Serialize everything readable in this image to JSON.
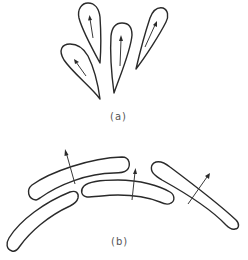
{
  "figure": {
    "panels": [
      {
        "id": "a",
        "label": "(a)",
        "description": "Four teardrop-shaped elements, each with an internal arrow pointing toward the rounded end",
        "elements": [
          {
            "name": "teardrop-1",
            "arrow": "up-left"
          },
          {
            "name": "teardrop-2",
            "arrow": "up"
          },
          {
            "name": "teardrop-3",
            "arrow": "up"
          },
          {
            "name": "teardrop-4",
            "arrow": "up-right"
          }
        ]
      },
      {
        "id": "b",
        "label": "(b)",
        "description": "Four curved elongated capsule bars arranged along an arc, three with crossing arrows normal to the bar",
        "elements": [
          {
            "name": "bar-upper-left",
            "arrow": "up-left"
          },
          {
            "name": "bar-lower-left",
            "arrow": "none"
          },
          {
            "name": "bar-middle",
            "arrow": "up"
          },
          {
            "name": "bar-right",
            "arrow": "up-right"
          }
        ]
      }
    ],
    "colors": {
      "stroke": "#2a2a2a",
      "background": "#ffffff",
      "label": "#555555"
    }
  }
}
